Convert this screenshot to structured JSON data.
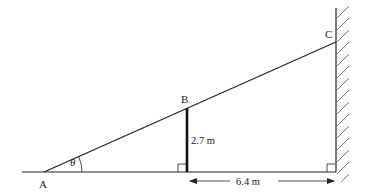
{
  "diagram": {
    "points": {
      "A": {
        "label": "A",
        "x": 44,
        "y": 172
      },
      "B": {
        "label": "B",
        "x": 187,
        "y": 108
      },
      "C": {
        "label": "C",
        "x": 336,
        "y": 42
      },
      "foot_B": {
        "x": 187,
        "y": 172
      },
      "foot_C": {
        "x": 336,
        "y": 172
      }
    },
    "angle_label": "θ",
    "labels": {
      "A": "A",
      "B": "B",
      "C": "C",
      "height": "2.7 m",
      "distance": "6.4 m"
    },
    "colors": {
      "line": "#222222",
      "hatch": "#555555",
      "background": "#ffffff"
    }
  }
}
